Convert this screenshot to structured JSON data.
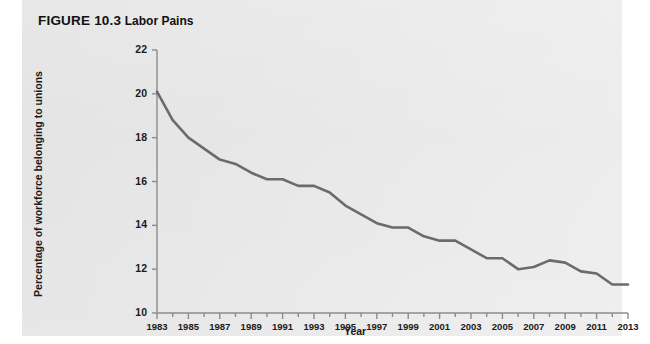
{
  "figure": {
    "number": "FIGURE 10.3",
    "name": "Labor Pains"
  },
  "colors": {
    "panel_background": "#e8e8e8",
    "page_background": "#ffffff",
    "line": "#6b6b6b",
    "axis": "#8c8c8c",
    "text": "#1a1a1a"
  },
  "chart_data": {
    "type": "line",
    "title": "Labor Pains",
    "xlabel": "Year",
    "ylabel": "Percentage of workforce belonging to unions",
    "xlim": [
      1983,
      2013
    ],
    "ylim": [
      10,
      22
    ],
    "grid": false,
    "legend": null,
    "x_tick_labels": [
      "1983",
      "1985",
      "1987",
      "1989",
      "1991",
      "1993",
      "1995",
      "1997",
      "1999",
      "2001",
      "2003",
      "2005",
      "2007",
      "2009",
      "2011",
      "2013"
    ],
    "y_tick_labels": [
      "10",
      "12",
      "14",
      "16",
      "18",
      "20",
      "22"
    ],
    "x_minor_tick_step": 1,
    "x": [
      1983,
      1984,
      1985,
      1986,
      1987,
      1988,
      1989,
      1990,
      1991,
      1992,
      1993,
      1994,
      1995,
      1996,
      1997,
      1998,
      1999,
      2000,
      2001,
      2002,
      2003,
      2004,
      2005,
      2006,
      2007,
      2008,
      2009,
      2010,
      2011,
      2012,
      2013
    ],
    "values": [
      20.1,
      18.8,
      18.0,
      17.5,
      17.0,
      16.8,
      16.4,
      16.1,
      16.1,
      15.8,
      15.8,
      15.5,
      14.9,
      14.5,
      14.1,
      13.9,
      13.9,
      13.5,
      13.3,
      13.3,
      12.9,
      12.5,
      12.5,
      12.0,
      12.1,
      12.4,
      12.3,
      11.9,
      11.8,
      11.3,
      11.3
    ],
    "series": [
      {
        "name": "Percentage of workforce belonging to unions",
        "values": [
          20.1,
          18.8,
          18.0,
          17.5,
          17.0,
          16.8,
          16.4,
          16.1,
          16.1,
          15.8,
          15.8,
          15.5,
          14.9,
          14.5,
          14.1,
          13.9,
          13.9,
          13.5,
          13.3,
          13.3,
          12.9,
          12.5,
          12.5,
          12.0,
          12.1,
          12.4,
          12.3,
          11.9,
          11.8,
          11.3,
          11.3
        ]
      }
    ]
  }
}
